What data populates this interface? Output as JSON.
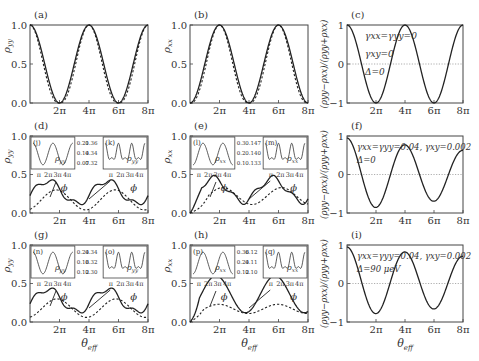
{
  "figure": {
    "x_tick_labels": [
      "2π",
      "4π",
      "6π",
      "8π"
    ],
    "xlabel": "θ_eff",
    "caption_fragment": "",
    "panels": [
      {
        "id": "a",
        "label": "(a)",
        "ylabel": "ρ_yy",
        "yticks": [
          "0.0",
          "0.5",
          "1.0"
        ]
      },
      {
        "id": "b",
        "label": "(b)",
        "ylabel": "ρ_xx",
        "yticks": [
          "0.0",
          "0.5",
          "1.0"
        ]
      },
      {
        "id": "c",
        "label": "(c)",
        "ylabel": "(ρ_yy−ρ_xx)/(ρ_yy+ρ_xx)",
        "yticks": [
          "−1",
          "0",
          "1"
        ],
        "annotations": [
          "γxx=γyy=0",
          "γxy=0",
          "Δ=0"
        ]
      },
      {
        "id": "d",
        "label": "(d)",
        "ylabel": "ρ_yy",
        "yticks": [
          "0.0",
          "0.5",
          "1.0"
        ],
        "insets": [
          {
            "label": "(j)",
            "var": "ρ_yy",
            "scale": [
              "0.21",
              "0.14",
              "0.07"
            ]
          },
          {
            "label": "(k)",
            "var": "ρ_yy",
            "scale": [
              "0.36",
              "0.34",
              "0.32"
            ]
          }
        ],
        "inset_xticks": [
          "π",
          "2π",
          "3π",
          "4π"
        ],
        "phi": "ϕ"
      },
      {
        "id": "e",
        "label": "(e)",
        "ylabel": "ρ_xx",
        "yticks": [
          "0.0",
          "0.5",
          "1.0"
        ],
        "insets": [
          {
            "label": "(l)",
            "var": "ρ_xx",
            "scale": [
              "0.3",
              "0.2",
              "0.1"
            ]
          },
          {
            "label": "(m)",
            "var": "ρ_xx",
            "scale": [
              "0.147",
              "0.140",
              "0.133"
            ]
          }
        ],
        "inset_xticks": [
          "π",
          "2π",
          "3π",
          "4π"
        ],
        "phi": "ϕ"
      },
      {
        "id": "f",
        "label": "(f)",
        "ylabel": "(ρ_yy−ρ_xx)/(ρ_yy+ρ_xx)",
        "yticks": [
          "−1",
          "0",
          "1"
        ],
        "annotations": [
          "γxx=γyy=0.04, γxy=0.002",
          "Δ=0"
        ]
      },
      {
        "id": "g",
        "label": "(g)",
        "ylabel": "ρ_yy",
        "yticks": [
          "0.0",
          "0.5",
          "1.0"
        ],
        "insets": [
          {
            "label": "(n)",
            "var": "ρ_yy",
            "scale": [
              "0.24",
              "0.18",
              "0.12"
            ]
          },
          {
            "label": "(o)",
            "var": "ρ_yy",
            "scale": [
              "0.34",
              "0.32",
              "0.30"
            ]
          }
        ],
        "inset_xticks": [
          "π",
          "2π",
          "3π",
          "4π"
        ],
        "phi": "ϕ"
      },
      {
        "id": "h",
        "label": "(h)",
        "ylabel": "ρ_xx",
        "yticks": [
          "0.0",
          "0.5",
          "1.0"
        ],
        "insets": [
          {
            "label": "(p)",
            "var": "ρ_xx",
            "scale": [
              "0.36",
              "0.24",
              "0.12"
            ]
          },
          {
            "label": "(q)",
            "var": "ρ_xx",
            "scale": [
              "0.12",
              "0.11",
              "0.10"
            ]
          }
        ],
        "inset_xticks": [
          "π",
          "2π",
          "3π",
          "4π"
        ],
        "phi": "ϕ"
      },
      {
        "id": "i",
        "label": "(i)",
        "ylabel": "(ρ_yy−ρ_xx)/(ρ_yy+ρ_xx)",
        "yticks": [
          "−1",
          "0",
          "1"
        ],
        "annotations": [
          "γxx=γyy=0.04, γxy=0.002",
          "Δ=90 μeV"
        ]
      }
    ]
  },
  "chart_data": [
    {
      "panel": "a",
      "type": "line",
      "xlabel": "θ_eff",
      "ylabel": "ρ_yy",
      "xlim": [
        0,
        "8π"
      ],
      "ylim": [
        0,
        1
      ],
      "x": [
        0,
        "2π",
        "4π",
        "6π",
        "8π"
      ],
      "series": [
        {
          "name": "solid",
          "values": [
            1.0,
            0.0,
            1.0,
            0.0,
            1.0
          ]
        },
        {
          "name": "dashed",
          "values": [
            1.0,
            0.0,
            1.0,
            0.0,
            1.0
          ]
        }
      ]
    },
    {
      "panel": "b",
      "type": "line",
      "xlabel": "θ_eff",
      "ylabel": "ρ_xx",
      "xlim": [
        0,
        "8π"
      ],
      "ylim": [
        0,
        1
      ],
      "x": [
        0,
        "2π",
        "4π",
        "6π",
        "8π"
      ],
      "series": [
        {
          "name": "solid",
          "values": [
            0.0,
            1.0,
            0.0,
            1.0,
            0.0
          ]
        },
        {
          "name": "dashed",
          "values": [
            0.0,
            1.0,
            0.0,
            1.0,
            0.0
          ]
        }
      ]
    },
    {
      "panel": "c",
      "type": "line",
      "ylim": [
        -1,
        1
      ],
      "x": [
        0,
        "2π",
        "4π",
        "6π",
        "8π"
      ],
      "series": [
        {
          "name": "solid",
          "values": [
            1,
            -1,
            1,
            -1,
            1
          ]
        }
      ]
    },
    {
      "panel": "d",
      "type": "line",
      "ylim": [
        0,
        1
      ],
      "x": [
        0,
        "π",
        "2π",
        "3.5π",
        "4π",
        "6π",
        "7.5π",
        "8π"
      ],
      "series": [
        {
          "name": "solid",
          "values": [
            0.2,
            0.28,
            0.08,
            0.43,
            0.36,
            0.13,
            0.44,
            0.4
          ]
        },
        {
          "name": "dashed",
          "values": [
            0.12,
            0.04,
            0.07,
            0.3,
            0.32,
            0.1,
            0.28,
            0.3
          ]
        }
      ]
    },
    {
      "panel": "e",
      "type": "line",
      "ylim": [
        0,
        1
      ],
      "x": [
        0,
        "1.5π",
        "2π",
        "4π",
        "5.5π",
        "6π",
        "8π"
      ],
      "series": [
        {
          "name": "solid",
          "values": [
            0.0,
            0.44,
            0.38,
            0.14,
            0.47,
            0.4,
            0.18
          ]
        },
        {
          "name": "dashed",
          "values": [
            0.0,
            0.3,
            0.34,
            0.14,
            0.3,
            0.34,
            0.14
          ]
        }
      ]
    },
    {
      "panel": "f",
      "type": "line",
      "ylim": [
        -1,
        1
      ],
      "x": [
        0,
        "2π",
        "4π",
        "6π",
        "8π"
      ],
      "series": [
        {
          "name": "solid",
          "values": [
            0.95,
            -0.72,
            0.68,
            -0.62,
            0.6
          ]
        }
      ]
    },
    {
      "panel": "g",
      "type": "line",
      "ylim": [
        0,
        1
      ],
      "x": [
        0,
        "π",
        "2π",
        "3.5π",
        "4π",
        "6π",
        "7.5π",
        "8π"
      ],
      "series": [
        {
          "name": "solid",
          "values": [
            0.18,
            0.3,
            0.12,
            0.45,
            0.35,
            0.15,
            0.45,
            0.4
          ]
        },
        {
          "name": "dashed",
          "values": [
            0.12,
            0.06,
            0.1,
            0.28,
            0.32,
            0.1,
            0.26,
            0.3
          ]
        }
      ]
    },
    {
      "panel": "h",
      "type": "line",
      "ylim": [
        0,
        1
      ],
      "x": [
        0,
        "2π",
        "4π",
        "6π",
        "8π"
      ],
      "series": [
        {
          "name": "solid",
          "values": [
            0.0,
            0.58,
            0.12,
            0.6,
            0.16
          ]
        },
        {
          "name": "dashed",
          "values": [
            0.0,
            0.22,
            0.12,
            0.24,
            0.14
          ]
        }
      ]
    },
    {
      "panel": "i",
      "type": "line",
      "ylim": [
        -1,
        1
      ],
      "x": [
        0,
        "2π",
        "4π",
        "6π",
        "8π"
      ],
      "series": [
        {
          "name": "solid",
          "values": [
            0.95,
            -0.55,
            0.62,
            -0.52,
            0.55
          ]
        }
      ]
    }
  ]
}
